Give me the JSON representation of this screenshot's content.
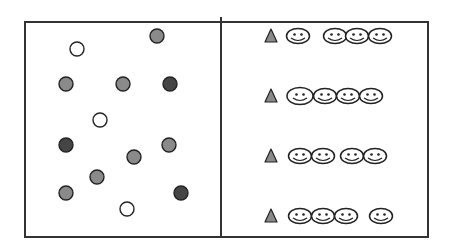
{
  "figure": {
    "width": 451,
    "height": 250,
    "colors": {
      "frame": "#333333",
      "circle_white": "#ffffff",
      "circle_grey": "#8a8a8a",
      "circle_dark": "#454545",
      "triangle": "#8a8a8a",
      "face_fill": "#ffffff",
      "stroke": "#222222"
    },
    "frame": {
      "left": 25,
      "top": 22,
      "right": 428,
      "bottom": 237
    },
    "divider": {
      "x": 221,
      "top": 17,
      "bottom": 237
    },
    "left_panel": {
      "label": "circles-panel",
      "circles": [
        {
          "cx": 77,
          "cy": 49,
          "shade": "white"
        },
        {
          "cx": 157,
          "cy": 36,
          "shade": "grey"
        },
        {
          "cx": 66,
          "cy": 84,
          "shade": "grey"
        },
        {
          "cx": 123,
          "cy": 84,
          "shade": "grey"
        },
        {
          "cx": 170,
          "cy": 84,
          "shade": "dark"
        },
        {
          "cx": 100,
          "cy": 120,
          "shade": "white"
        },
        {
          "cx": 66,
          "cy": 145,
          "shade": "dark"
        },
        {
          "cx": 169,
          "cy": 145,
          "shade": "grey"
        },
        {
          "cx": 134,
          "cy": 157,
          "shade": "grey"
        },
        {
          "cx": 97,
          "cy": 177,
          "shade": "grey"
        },
        {
          "cx": 66,
          "cy": 193,
          "shade": "grey"
        },
        {
          "cx": 181,
          "cy": 193,
          "shade": "dark"
        },
        {
          "cx": 127,
          "cy": 209,
          "shade": "white"
        }
      ]
    },
    "right_panel": {
      "label": "faces-panel",
      "rows": [
        {
          "y": 36,
          "triangle_x": 271,
          "faces": [
            {
              "x": 298
            },
            {
              "x": 335
            },
            {
              "x": 357
            },
            {
              "x": 380
            }
          ]
        },
        {
          "y": 96,
          "triangle_x": 271,
          "faces": [
            {
              "x": 300,
              "large": true
            },
            {
              "x": 325
            },
            {
              "x": 348
            },
            {
              "x": 371
            }
          ]
        },
        {
          "y": 156,
          "triangle_x": 271,
          "faces": [
            {
              "x": 300
            },
            {
              "x": 323
            },
            {
              "x": 352
            },
            {
              "x": 375
            }
          ]
        },
        {
          "y": 216,
          "triangle_x": 271,
          "faces": [
            {
              "x": 300
            },
            {
              "x": 323
            },
            {
              "x": 346
            },
            {
              "x": 381
            }
          ]
        }
      ]
    }
  }
}
